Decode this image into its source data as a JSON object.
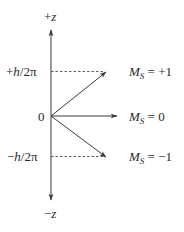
{
  "axis": {
    "top_label_sign": "+",
    "top_label_var": "z",
    "bottom_label_sign": "−",
    "bottom_label_var": "z",
    "origin_label": "0"
  },
  "levels": [
    {
      "sign": "+",
      "var": "h",
      "rest": "/2π",
      "ms_value": "+1"
    },
    {
      "sign": "",
      "var": "",
      "rest": "",
      "ms_value": "0"
    },
    {
      "sign": "−",
      "var": "h",
      "rest": "/2π",
      "ms_value": "−1"
    }
  ],
  "ms_label": {
    "symbol": "M",
    "subscript": "S",
    "equals": " = "
  },
  "colors": {
    "line": "#3a3a3a",
    "text": "#2a2a2a",
    "background": "#ffffff"
  }
}
